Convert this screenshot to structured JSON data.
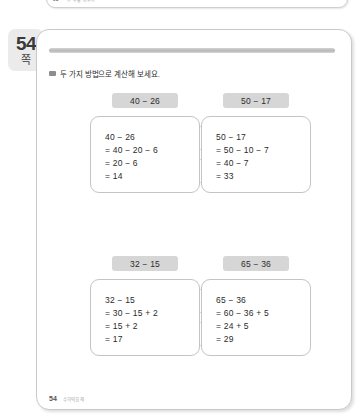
{
  "top_peek": {
    "page_number": "53",
    "caption": "두 수를 바꾸어"
  },
  "page_tab": {
    "number": "54",
    "unit": "쪽"
  },
  "instruction": {
    "bullet_icon": "square-bullet-icon",
    "text": "두 가지 방법으로 계산해 보세요."
  },
  "problems": [
    {
      "chip": "40 − 26",
      "lines": [
        "40 − 26",
        "= 40 − 20 − 6",
        "= 20 − 6",
        "= 14"
      ]
    },
    {
      "chip": "50 − 17",
      "lines": [
        "50 − 17",
        "= 50 − 10 − 7",
        "= 40 − 7",
        "= 33"
      ]
    },
    {
      "chip": "32 − 15",
      "lines": [
        "32 − 15",
        "= 30 − 15 + 2",
        "= 15 + 2",
        "= 17"
      ]
    },
    {
      "chip": "65 − 36",
      "lines": [
        "65 − 36",
        "= 60 − 36 + 5",
        "= 24 + 5",
        "= 29"
      ]
    }
  ],
  "footer": {
    "page_number": "54",
    "caption": "수학익힘책"
  },
  "colors": {
    "chip_bg": "#d6d6d6",
    "tab_bg": "#ebebeb",
    "text": "#2b2b2b",
    "border": "#c4c4c4"
  }
}
